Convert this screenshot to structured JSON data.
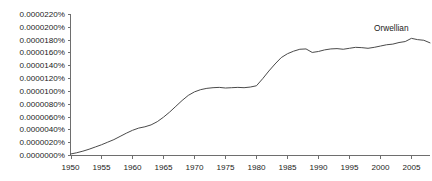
{
  "chart_data": {
    "type": "line",
    "title": "",
    "xlabel": "",
    "ylabel": "",
    "xlim": [
      1950,
      2008
    ],
    "ylim": [
      0.0,
      2.2e-05
    ],
    "grid": false,
    "legend_position": "inline-annotation",
    "y_tick_labels": [
      "0.0000220%",
      "0.0000200%",
      "0.0000180%",
      "0.0000160%",
      "0.0000140%",
      "0.0000120%",
      "0.0000100%",
      "0.0000080%",
      "0.0000060%",
      "0.0000040%",
      "0.0000020%",
      "0.0000000%"
    ],
    "y_tick_values": [
      2.2e-05,
      2e-05,
      1.8e-05,
      1.6e-05,
      1.4e-05,
      1.2e-05,
      1e-05,
      8e-06,
      6e-06,
      4e-06,
      2e-06,
      0.0
    ],
    "x_tick_labels": [
      "1950",
      "1955",
      "1960",
      "1965",
      "1970",
      "1975",
      "1980",
      "1985",
      "1990",
      "1995",
      "2000",
      "2005"
    ],
    "x_tick_values": [
      1950,
      1955,
      1960,
      1965,
      1970,
      1975,
      1980,
      1985,
      1990,
      1995,
      2000,
      2005
    ],
    "series": [
      {
        "name": "Orwellian",
        "color": "#4a4a4a",
        "annotation_label": "Orwellian",
        "x": [
          1950,
          1951,
          1952,
          1953,
          1954,
          1955,
          1956,
          1957,
          1958,
          1959,
          1960,
          1961,
          1962,
          1963,
          1964,
          1965,
          1966,
          1967,
          1968,
          1969,
          1970,
          1971,
          1972,
          1973,
          1974,
          1975,
          1976,
          1977,
          1978,
          1979,
          1980,
          1981,
          1982,
          1983,
          1984,
          1985,
          1986,
          1987,
          1988,
          1989,
          1990,
          1991,
          1992,
          1993,
          1994,
          1995,
          1996,
          1997,
          1998,
          1999,
          2000,
          2001,
          2002,
          2003,
          2004,
          2005,
          2006,
          2007,
          2008
        ],
        "values": [
          1.5e-07,
          3.5e-07,
          6e-07,
          9e-07,
          1.25e-06,
          1.6e-06,
          2e-06,
          2.4e-06,
          2.9e-06,
          3.4e-06,
          3.85e-06,
          4.2e-06,
          4.4e-06,
          4.7e-06,
          5.2e-06,
          5.9e-06,
          6.7e-06,
          7.6e-06,
          8.5e-06,
          9.3e-06,
          9.85e-06,
          1.02e-05,
          1.04e-05,
          1.05e-05,
          1.055e-05,
          1.045e-05,
          1.05e-05,
          1.055e-05,
          1.05e-05,
          1.06e-05,
          1.08e-05,
          1.19e-05,
          1.31e-05,
          1.42e-05,
          1.52e-05,
          1.58e-05,
          1.62e-05,
          1.65e-05,
          1.655e-05,
          1.6e-05,
          1.615e-05,
          1.64e-05,
          1.655e-05,
          1.66e-05,
          1.65e-05,
          1.665e-05,
          1.68e-05,
          1.675e-05,
          1.665e-05,
          1.68e-05,
          1.7e-05,
          1.72e-05,
          1.73e-05,
          1.755e-05,
          1.77e-05,
          1.82e-05,
          1.8e-05,
          1.79e-05,
          1.75e-05
        ]
      }
    ]
  },
  "annotation": {
    "label": "Orwellian"
  }
}
